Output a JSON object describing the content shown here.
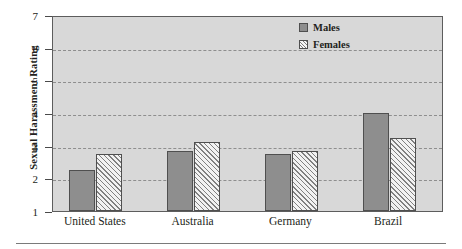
{
  "chart_data": {
    "type": "bar",
    "title": "",
    "xlabel": "",
    "ylabel": "Sexual Harassment Rating",
    "ylim": [
      1,
      7
    ],
    "yticks": [
      1,
      2,
      3,
      4,
      5,
      6,
      7
    ],
    "ytick_labels": [
      "1",
      "2",
      "3",
      "4",
      "5",
      "6",
      "7"
    ],
    "gridlines": [
      2,
      3,
      4,
      5,
      6
    ],
    "grid": true,
    "legend_position": "top-right",
    "categories": [
      "United States",
      "Australia",
      "Germany",
      "Brazil"
    ],
    "series": [
      {
        "name": "Males",
        "values": [
          2.25,
          2.85,
          2.75,
          4.0
        ],
        "color": "#8e8e8e",
        "pattern": "solid"
      },
      {
        "name": "Females",
        "values": [
          2.75,
          3.1,
          2.85,
          3.25
        ],
        "color": "#f2f2f2",
        "pattern": "diagonal-hatch"
      }
    ]
  },
  "axis": {
    "y_title": "Sexual Harassment Rating",
    "y_tick_labels": [
      "7",
      "6",
      "5",
      "4",
      "3",
      "2",
      "1"
    ]
  },
  "legend": {
    "items": [
      {
        "label": "Males",
        "swatch": "solid-gray-swatch"
      },
      {
        "label": "Females",
        "swatch": "hatched-swatch"
      }
    ]
  },
  "x_axis": {
    "labels": [
      "United States",
      "Australia",
      "Germany",
      "Brazil"
    ]
  }
}
